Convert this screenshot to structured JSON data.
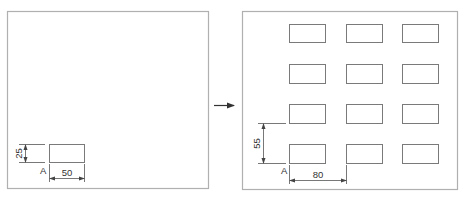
{
  "left_panel": {
    "part_width_label": "50",
    "part_height_label": "25",
    "origin_label": "A"
  },
  "right_panel": {
    "horizontal_pitch_label": "80",
    "vertical_pitch_label": "55",
    "origin_label": "A",
    "grid": {
      "rows": 4,
      "columns": 3
    }
  },
  "colors": {
    "frame": "#b0b0b0",
    "part_outline": "#7a7a7a",
    "dimension": "#555555",
    "arrow": "#333333"
  }
}
